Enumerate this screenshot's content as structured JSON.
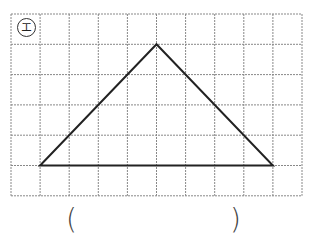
{
  "problem": {
    "label": "エ",
    "grid": {
      "cols": 10,
      "rows": 6,
      "x0": 11,
      "y0": 14,
      "cell_w": 29.1,
      "cell_h": 30.3,
      "line_color": "#888888"
    },
    "shape": {
      "type": "triangle",
      "vertices_grid": [
        [
          1,
          5
        ],
        [
          5,
          1
        ],
        [
          9,
          5
        ]
      ],
      "stroke": "#222222"
    },
    "answer": {
      "open_paren": "(",
      "close_paren": ")",
      "value": ""
    }
  }
}
